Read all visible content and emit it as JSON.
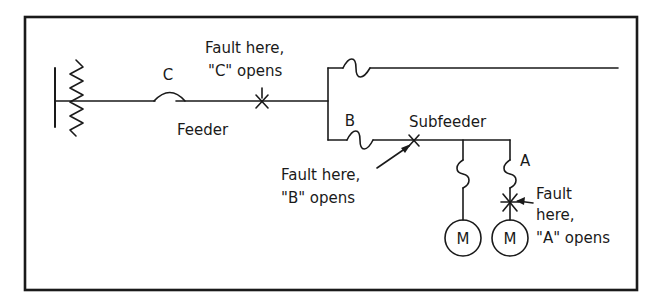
{
  "diagram": {
    "labels": {
      "breaker_c": "C",
      "fuse_b": "B",
      "fuse_a": "A",
      "feeder": "Feeder",
      "subfeeder": "Subfeeder",
      "motor_1": "M",
      "motor_2": "M"
    },
    "annotations": {
      "fault_c_line1": "Fault here,",
      "fault_c_line2": "\"C\" opens",
      "fault_b_line1": "Fault here,",
      "fault_b_line2": "\"B\" opens",
      "fault_a_line1": "Fault",
      "fault_a_line2": "here,",
      "fault_a_line3": "\"A\" opens"
    },
    "components": [
      {
        "id": "bus",
        "type": "busbar"
      },
      {
        "id": "source-impedance",
        "type": "resistor"
      },
      {
        "id": "C",
        "type": "circuit-breaker"
      },
      {
        "id": "top-fuse",
        "type": "fuse"
      },
      {
        "id": "B",
        "type": "fuse"
      },
      {
        "id": "branch-fuse",
        "type": "fuse"
      },
      {
        "id": "A",
        "type": "fuse"
      },
      {
        "id": "motor-1",
        "type": "motor",
        "label": "M"
      },
      {
        "id": "motor-2",
        "type": "motor",
        "label": "M"
      }
    ],
    "colors": {
      "ink": "#1a1a1a",
      "background": "#ffffff"
    }
  }
}
